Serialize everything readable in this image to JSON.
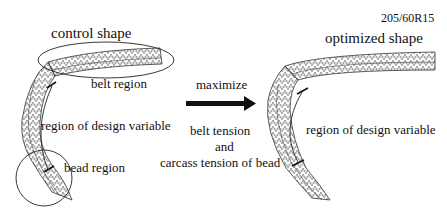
{
  "tire_size": "205/60R15",
  "left_panel": {
    "title": "control shape",
    "labels": {
      "belt": "belt region",
      "design": "region of design variable",
      "bead": "bead region"
    }
  },
  "center": {
    "action": "maximize",
    "objective_line1": "belt tension",
    "objective_line2": "and",
    "objective_line3": "carcass tension of bead"
  },
  "right_panel": {
    "title": "optimized shape",
    "labels": {
      "design": "region of design variable"
    }
  },
  "colors": {
    "line": "#222222",
    "mesh": "#555555",
    "background": "#ffffff"
  }
}
